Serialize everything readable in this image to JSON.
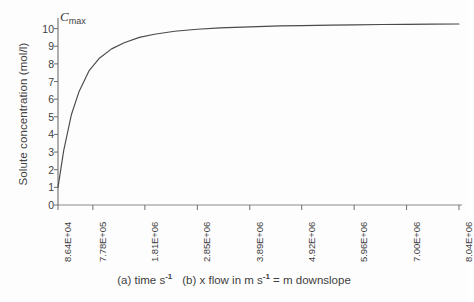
{
  "figure": {
    "annotation_label": "C",
    "annotation_sub": "max",
    "caption_a": "(a) time s",
    "caption_a_sup": "-1",
    "caption_b": "(b) x flow in m s",
    "caption_b_sup": "-1",
    "caption_b_tail": "= m downslope"
  },
  "chart_data": {
    "type": "line",
    "title": "",
    "xlabel": "(a) time s-1   (b) x flow in m s-1 = m downslope",
    "ylabel": "Solute concentration (mol/l)",
    "grid": false,
    "legend": "none",
    "ylim": [
      0,
      10.6
    ],
    "yticks": [
      10,
      9,
      8,
      7,
      6,
      5,
      4,
      3,
      2,
      1,
      0
    ],
    "ytick_labels": [
      "10",
      "9",
      "8",
      "7",
      "6",
      "5",
      "4",
      "3",
      "2",
      "1",
      "0"
    ],
    "xtick_labels": [
      "8.64E+04",
      "7.78E+05",
      "1.81E+06",
      "2.85E+06",
      "3.89E+06",
      "4.92E+06",
      "5.96E+06",
      "7.00E+06",
      "8.04E+06"
    ],
    "xtick_values": [
      86400,
      778000,
      1810000,
      2850000,
      3890000,
      4920000,
      5960000,
      7000000,
      8040000
    ],
    "annotations": [
      {
        "text": "Cmax",
        "x": 86400,
        "y": 10.25
      }
    ],
    "series": [
      {
        "name": "Solute concentration",
        "x": [
          86400,
          200000,
          350000,
          500000,
          700000,
          900000,
          1150000,
          1400000,
          1700000,
          2000000,
          2400000,
          2850000,
          3300000,
          3890000,
          4500000,
          4920000,
          5500000,
          5960000,
          6500000,
          7000000,
          7500000,
          8040000
        ],
        "y": [
          1.0,
          3.1,
          5.1,
          6.4,
          7.6,
          8.3,
          8.85,
          9.2,
          9.5,
          9.68,
          9.85,
          9.96,
          10.04,
          10.1,
          10.15,
          10.17,
          10.2,
          10.21,
          10.23,
          10.24,
          10.25,
          10.26
        ]
      }
    ]
  },
  "colors": {
    "curve": "#4a4a4a",
    "axis": "#6e6e6e",
    "text": "#3f3f3f",
    "background": "#fdfdfd"
  }
}
